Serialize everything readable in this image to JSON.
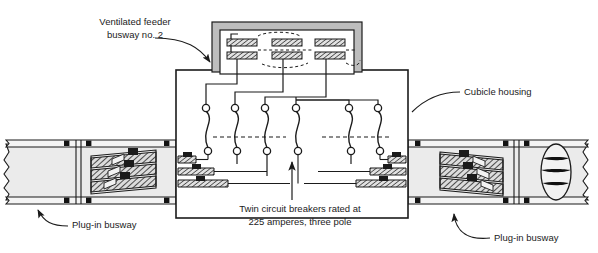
{
  "figure": {
    "kind": "electrical-busway-cubicle-cutaway-diagram",
    "width": 598,
    "height": 253,
    "background_color": "#ffffff",
    "line_color": "#1b1b1b",
    "housing_fill": "#e8e8e8",
    "busbar_fill": "#d9d9d9",
    "bolt_color": "#121212"
  },
  "labels": {
    "ventilated_feeder_busway": "Ventilated feeder\nbusway no. 2",
    "ventilated_feeder_busway_line1": "Ventilated feeder",
    "ventilated_feeder_busway_line2": "busway no. 2",
    "cubicle_housing": "Cubicle housing",
    "twin_breakers_line1": "Twin circuit breakers rated at",
    "twin_breakers_line2": "225 amperes, three pole",
    "plug_in_busway_left": "Plug-in busway",
    "plug_in_busway_right": "Plug-in busway"
  },
  "components": {
    "cubicle_housing": {
      "name": "Cubicle housing",
      "shape": "rectangle",
      "x": 176,
      "y": 70,
      "width": 232,
      "height": 148
    },
    "ventilated_feeder_busway": {
      "name": "Ventilated feeder busway no. 2",
      "busbar_rows": 2,
      "busbars_per_row": 3,
      "x": 212,
      "y": 22,
      "width": 150,
      "height": 50
    },
    "twin_circuit_breakers": {
      "name": "Twin circuit breakers",
      "rating_amperes": 225,
      "poles": 3,
      "pole_count_drawn": 6,
      "contact_pairs": 6,
      "description": "Twin circuit breakers rated at 225 amperes, three pole"
    },
    "plug_in_busway_left": {
      "name": "Plug-in busway",
      "x": 2,
      "y": 140,
      "width": 174,
      "height": 64,
      "busbars": 3,
      "stab_connectors": 3,
      "end_style": "break-line"
    },
    "plug_in_busway_right": {
      "name": "Plug-in busway",
      "x": 408,
      "y": 140,
      "width": 186,
      "height": 64,
      "busbars": 3,
      "stab_connectors": 3,
      "end_style": "elliptical-section"
    }
  },
  "annotations": {
    "leader_feeder_to_busway": "curved arrow from 'Ventilated feeder busway no. 2' to feeder busway",
    "leader_cubicle": "curved leader from 'Cubicle housing' to cubicle wall",
    "leader_plugin_left": "curved arrow from 'Plug-in busway' up to left busway",
    "leader_plugin_right": "curved arrow from 'Plug-in busway' up to right busway",
    "arrow_breakers": "vertical arrow pointing up from breaker caption to breaker contacts"
  }
}
